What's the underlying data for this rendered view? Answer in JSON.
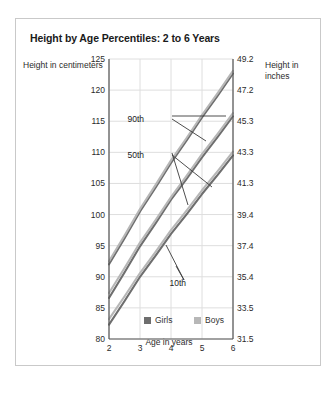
{
  "figure": {
    "title": "Height by Age Percentiles: 2 to 6 Years",
    "ylabel_left": "Height in centimeters",
    "ylabel_right": "Height in inches",
    "xlabel": "Age in years"
  },
  "colors": {
    "girls": "#6e6e6e",
    "boys": "#b7b7b7",
    "axis": "#555555",
    "grid": "#dedede",
    "frame": "#c9c9c9",
    "text": "#2b2b2b",
    "title": "#1a1a1a"
  },
  "legend": {
    "items": [
      {
        "label": "Girls",
        "color": "#6e6e6e"
      },
      {
        "label": "Boys",
        "color": "#b7b7b7"
      }
    ]
  },
  "annotations": [
    {
      "label": "90th"
    },
    {
      "label": "50th"
    },
    {
      "label": "10th"
    }
  ],
  "chart_data": {
    "type": "line",
    "title": "Height by Age Percentiles: 2 to 6 Years",
    "xlabel": "Age in years",
    "ylabel": "Height in centimeters",
    "ylabel_secondary": "Height in inches",
    "grid": true,
    "legend_position": "bottom-center",
    "x": [
      2,
      3,
      4,
      5,
      6
    ],
    "xlim": [
      2,
      6
    ],
    "xticks": [
      2,
      3,
      4,
      5,
      6
    ],
    "xtick_labels": [
      "2",
      "3",
      "4",
      "5",
      "6"
    ],
    "ylim": [
      80,
      125
    ],
    "yticks": [
      80,
      85,
      90,
      95,
      100,
      105,
      110,
      115,
      120,
      125
    ],
    "ytick_labels": [
      "80",
      "85",
      "90",
      "95",
      "100",
      "105",
      "110",
      "115",
      "120",
      "125"
    ],
    "ylim_secondary": [
      31.5,
      49.2
    ],
    "yticks_secondary": [
      31.5,
      33.5,
      35.4,
      37.4,
      39.4,
      41.3,
      43.3,
      45.3,
      47.2,
      49.2
    ],
    "ytick_labels_secondary": [
      "31.5",
      "33.5",
      "35.4",
      "37.4",
      "39.4",
      "41.3",
      "43.3",
      "45.3",
      "47.2",
      "49.2"
    ],
    "series": [
      {
        "name": "Girls 90th",
        "percentile": "90th",
        "group": "Girls",
        "color": "#6e6e6e",
        "values": [
          92.0,
          100.5,
          108.3,
          115.6,
          122.7
        ]
      },
      {
        "name": "Boys 90th",
        "percentile": "90th",
        "group": "Boys",
        "color": "#b7b7b7",
        "values": [
          92.5,
          100.9,
          108.7,
          116.0,
          123.1
        ]
      },
      {
        "name": "Girls 50th",
        "percentile": "50th",
        "group": "Girls",
        "color": "#6e6e6e",
        "values": [
          86.6,
          94.9,
          102.4,
          109.2,
          115.8
        ]
      },
      {
        "name": "Boys 50th",
        "percentile": "50th",
        "group": "Boys",
        "color": "#b7b7b7",
        "values": [
          87.4,
          95.5,
          102.8,
          109.7,
          116.3
        ]
      },
      {
        "name": "Girls 10th",
        "percentile": "10th",
        "group": "Girls",
        "color": "#6e6e6e",
        "values": [
          82.3,
          90.0,
          96.9,
          103.3,
          109.5
        ]
      },
      {
        "name": "Boys 10th",
        "percentile": "10th",
        "group": "Boys",
        "color": "#b7b7b7",
        "values": [
          83.2,
          90.6,
          97.5,
          103.9,
          110.1
        ]
      }
    ]
  }
}
